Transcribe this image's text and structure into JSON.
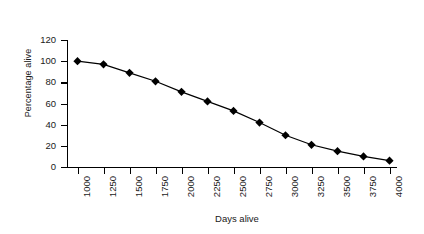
{
  "chart_data": {
    "type": "line",
    "title": "",
    "xlabel": "Days alive",
    "ylabel": "Percentage alive",
    "categories": [
      "1000",
      "1250",
      "1500",
      "1750",
      "2000",
      "2250",
      "2500",
      "2750",
      "3000",
      "3250",
      "3500",
      "3750",
      "4000"
    ],
    "values": [
      100,
      97,
      89,
      81,
      71,
      62,
      53,
      42,
      30,
      21,
      15,
      10,
      6
    ],
    "series": [
      {
        "name": "Percentage alive",
        "values": [
          100,
          97,
          89,
          81,
          71,
          62,
          53,
          42,
          30,
          21,
          15,
          10,
          6
        ],
        "marker": "diamond",
        "color": "#000000"
      }
    ],
    "ylim": [
      0,
      120
    ],
    "yticks": [
      0,
      20,
      40,
      60,
      80,
      100,
      120
    ],
    "ytick_labels": [
      "0",
      "20",
      "40",
      "60",
      "80",
      "100",
      "120"
    ],
    "xlim_categories": 13,
    "grid": false,
    "legend": null,
    "legend_position": "none",
    "xtick_label_rotation": 90,
    "line_color": "#000000",
    "marker_color": "#000000",
    "background_color": "#ffffff"
  },
  "axes": {
    "y_title": "Percentage alive",
    "x_title": "Days alive"
  }
}
